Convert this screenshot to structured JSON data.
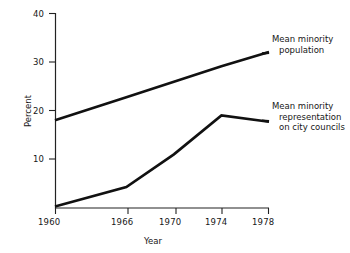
{
  "chart_data": {
    "type": "line",
    "title": "",
    "xlabel": "Year",
    "ylabel": "Percent",
    "x": [
      1960,
      1966,
      1970,
      1974,
      1978
    ],
    "xtick_labels": [
      "1960",
      "1966",
      "1970",
      "1974",
      "1978"
    ],
    "ytick_labels": [
      "10",
      "20",
      "30",
      "40"
    ],
    "yticks": [
      10,
      20,
      30,
      40
    ],
    "xlim": [
      1960,
      1978
    ],
    "ylim": [
      0,
      40
    ],
    "grid": false,
    "legend_position": "inline-annotations",
    "series": [
      {
        "name": "Mean minority population",
        "annotation_lines": [
          "Mean minority",
          "population"
        ],
        "values": [
          18,
          22.7,
          25.9,
          29.1,
          32
        ]
      },
      {
        "name": "Mean minority representation on city councils",
        "annotation_lines": [
          "Mean minority",
          "representation",
          "on city councils"
        ],
        "values": [
          0.3,
          4.3,
          11,
          19,
          17.7
        ]
      }
    ],
    "line_color": "#111111",
    "axis_color": "#222222"
  },
  "axes": {
    "ylabel": "Percent",
    "xlabel": "Year",
    "ytick_0": "10",
    "ytick_1": "20",
    "ytick_2": "30",
    "ytick_3": "40",
    "xtick_0": "1960",
    "xtick_1": "1966",
    "xtick_2": "1970",
    "xtick_3": "1974",
    "xtick_4": "1978"
  },
  "annotations": {
    "population": {
      "line1": "Mean minority",
      "line2": "population"
    },
    "representation": {
      "line1": "Mean minority",
      "line2": "representation",
      "line3": "on city councils"
    }
  }
}
